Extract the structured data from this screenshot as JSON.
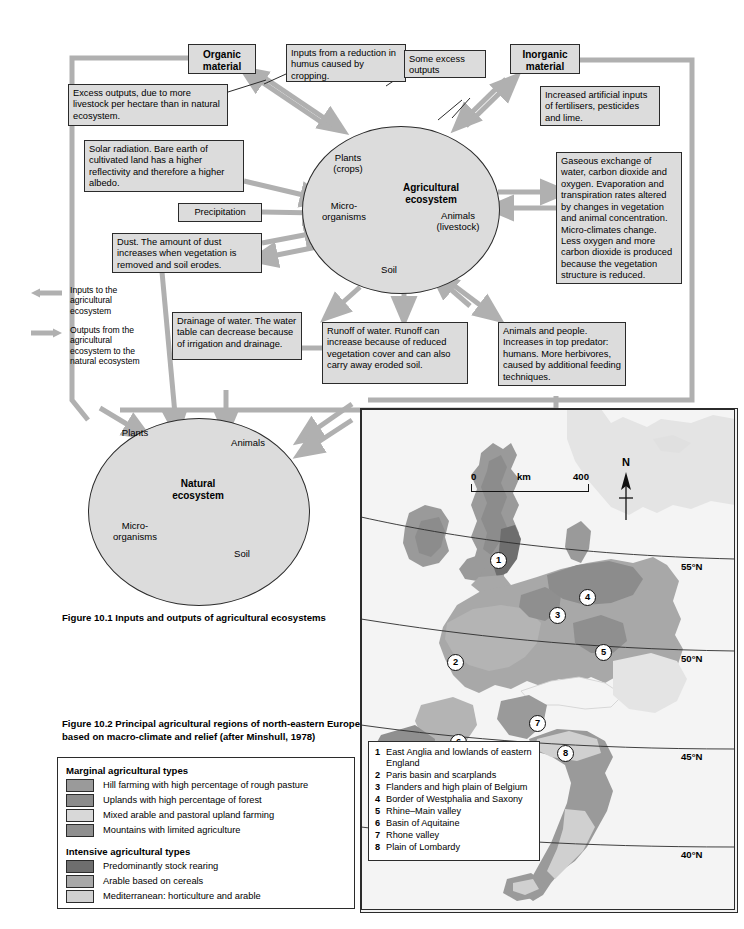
{
  "figure1": {
    "caption": "Figure 10.1  Inputs and outputs of agricultural ecosystems",
    "nodes": {
      "organic": "Organic\nmaterial",
      "organic_l1": "Organic",
      "organic_l2": "material",
      "inorganic_l1": "Inorganic",
      "inorganic_l2": "material"
    },
    "boxes": {
      "humus": "Inputs from a reduction in humus caused by cropping.",
      "excess_outputs_left": "Excess outputs, due to more livestock per hectare than in natural ecosystem.",
      "some_excess": "Some excess outputs",
      "fertilisers": "Increased artificial inputs of fertilisers, pesticides and lime.",
      "solar": "Solar radiation. Bare earth of cultivated land has a higher reflectivity and therefore a higher albedo.",
      "precipitation": "Precipitation",
      "dust": "Dust. The amount of dust increases when vegetation is removed and soil erodes.",
      "gaseous": "Gaseous exchange of water, carbon dioxide and oxygen. Evaporation and transpiration rates altered by changes in vegetation and animal concentration. Micro-climates change. Less oxygen and more carbon dioxide is produced because the vegetation structure is reduced.",
      "drainage": "Drainage of water. The water table can decrease because of irrigation and drainage.",
      "runoff": "Runoff of water. Runoff can increase because of reduced vegetation cover and can also carry away eroded soil.",
      "animals_people": "Animals and people. Increases in top predator: humans. More herbivores, caused by additional feeding techniques."
    },
    "agricultural_circle": {
      "title_l1": "Agricultural",
      "title_l2": "ecosystem",
      "plants_l1": "Plants",
      "plants_l2": "(crops)",
      "micro_l1": "Micro-",
      "micro_l2": "organisms",
      "animals_l1": "Animals",
      "animals_l2": "(livestock)",
      "soil": "Soil"
    },
    "natural_circle": {
      "title_l1": "Natural",
      "title_l2": "ecosystem",
      "plants": "Plants",
      "micro_l1": "Micro-",
      "micro_l2": "organisms",
      "animals": "Animals",
      "soil": "Soil"
    },
    "key": {
      "inputs": "Inputs to the agricultural ecosystem",
      "outputs": "Outputs from the agricultural ecosystem to the natural ecosystem"
    }
  },
  "figure2": {
    "caption_l1": "Figure 10.2  Principal agricultural regions of north-eastern Europe",
    "caption_l2": "based on macro-climate and relief (after Minshull, 1978)",
    "legend": {
      "group1_title": "Marginal agricultural types",
      "group1": [
        {
          "label": "Hill farming with high percentage of rough pasture",
          "color": "#9a9a9a"
        },
        {
          "label": "Uplands with high percentage of forest",
          "color": "#8c8c8c"
        },
        {
          "label": "Mixed arable and pastoral upland farming",
          "color": "#d8d8d8"
        },
        {
          "label": "Mountains with limited agriculture",
          "color": "#8f8f8f"
        }
      ],
      "group2_title": "Intensive agricultural types",
      "group2": [
        {
          "label": "Predominantly stock rearing",
          "color": "#6e6e6e"
        },
        {
          "label": "Arable based on cereals",
          "color": "#a8a8a8"
        },
        {
          "label": "Mediterranean: horticulture and arable",
          "color": "#d0d0d0"
        }
      ]
    },
    "map": {
      "north_label": "N",
      "scale": {
        "start": "0",
        "unit": "km",
        "end": "400"
      },
      "latitudes": [
        "55°N",
        "50°N",
        "45°N",
        "40°N"
      ],
      "regions": [
        {
          "num": "1",
          "label": "East Anglia and lowlands of eastern England"
        },
        {
          "num": "2",
          "label": "Paris basin and scarplands"
        },
        {
          "num": "3",
          "label": "Flanders and high plain of Belgium"
        },
        {
          "num": "4",
          "label": "Border of Westphalia and Saxony"
        },
        {
          "num": "5",
          "label": "Rhine–Main valley"
        },
        {
          "num": "6",
          "label": "Basin of Aquitaine"
        },
        {
          "num": "7",
          "label": "Rhone valley"
        },
        {
          "num": "8",
          "label": "Plain of Lombardy"
        }
      ],
      "markers": [
        {
          "num": "1",
          "x": 129,
          "y": 143
        },
        {
          "num": "2",
          "x": 86,
          "y": 245
        },
        {
          "num": "3",
          "x": 188,
          "y": 198
        },
        {
          "num": "4",
          "x": 218,
          "y": 180
        },
        {
          "num": "5",
          "x": 234,
          "y": 235
        },
        {
          "num": "6",
          "x": 89,
          "y": 325
        },
        {
          "num": "7",
          "x": 168,
          "y": 306
        },
        {
          "num": "8",
          "x": 196,
          "y": 336
        }
      ]
    }
  },
  "colors": {
    "box_fill": "#dcdcdc",
    "arrow": "#b0b0b0",
    "outline": "#2b2b2b"
  }
}
